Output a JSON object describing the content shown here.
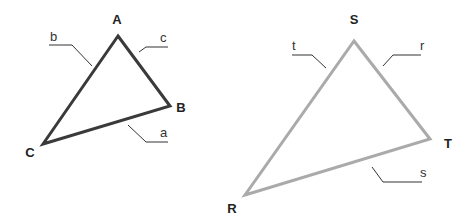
{
  "figure": {
    "triangles": [
      {
        "name": "triangle-abc",
        "stroke": "#3a3a3a",
        "vertices": [
          {
            "label": "A",
            "x": 118,
            "y": 36,
            "lx": 117,
            "ly": 24
          },
          {
            "label": "B",
            "x": 170,
            "y": 106,
            "lx": 181,
            "ly": 112
          },
          {
            "label": "C",
            "x": 43,
            "y": 144,
            "lx": 30,
            "ly": 157
          }
        ],
        "sides": [
          {
            "label": "b",
            "tx": 50,
            "ty": 41,
            "path": "M49,45 L72,45 L92,66"
          },
          {
            "label": "c",
            "tx": 160,
            "ty": 42,
            "path": "M168,47 L146,47 L139,52"
          },
          {
            "label": "a",
            "tx": 160,
            "ty": 137,
            "path": "M128,125 L146,142 L168,142"
          }
        ]
      },
      {
        "name": "triangle-rst",
        "stroke": "#aaaaaa",
        "vertices": [
          {
            "label": "S",
            "x": 354,
            "y": 41,
            "lx": 354,
            "ly": 24
          },
          {
            "label": "T",
            "x": 430,
            "y": 139,
            "lx": 448,
            "ly": 148
          },
          {
            "label": "R",
            "x": 245,
            "y": 195,
            "lx": 232,
            "ly": 213
          }
        ],
        "sides": [
          {
            "label": "t",
            "tx": 292,
            "ty": 50,
            "path": "M292,55 L312,55 L326,68"
          },
          {
            "label": "r",
            "tx": 420,
            "ty": 50,
            "path": "M421,55 L393,55 L383,66"
          },
          {
            "label": "s",
            "tx": 420,
            "ty": 177,
            "path": "M372,167 L383,182 L422,182"
          }
        ]
      }
    ]
  }
}
